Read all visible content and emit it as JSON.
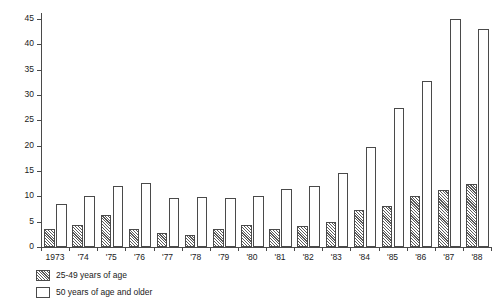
{
  "chart_data": {
    "type": "bar",
    "title": "",
    "subtitle": "",
    "xlabel": "",
    "ylabel": "",
    "ylim": [
      0,
      46
    ],
    "yticks": [
      0,
      5,
      10,
      15,
      20,
      25,
      30,
      35,
      40,
      45
    ],
    "ytick_labels": [
      "0",
      "5",
      "10",
      "15",
      "20",
      "25",
      "30",
      "35",
      "40",
      "45"
    ],
    "grid": false,
    "legend_position": "below-left",
    "categories": [
      "1973",
      "'74",
      "'75",
      "'76",
      "'77",
      "'78",
      "'79",
      "'80",
      "'81",
      "'82",
      "'83",
      "'84",
      "'85",
      "'86",
      "'87",
      "'88"
    ],
    "series": [
      {
        "name": "25-49 years of age",
        "style": "hatched",
        "values": [
          3.5,
          4.3,
          6.4,
          3.6,
          2.8,
          2.4,
          3.5,
          4.4,
          3.5,
          4.1,
          5.0,
          7.3,
          8.0,
          10.0,
          11.3,
          12.5
        ]
      },
      {
        "name": "50 years of age and older",
        "style": "open",
        "values": [
          8.4,
          10.0,
          12.0,
          12.7,
          9.6,
          9.8,
          9.6,
          10.1,
          11.5,
          12.0,
          14.6,
          19.7,
          27.4,
          32.7,
          45.0,
          43.0
        ]
      }
    ]
  },
  "legend": {
    "items": [
      {
        "label": "25-49 years of age",
        "style": "hatched"
      },
      {
        "label": "50 years of age and older",
        "style": "open"
      }
    ]
  },
  "colors": {
    "axis": "#4a4a4a",
    "hatch": "#5a5a5a",
    "bar_fill": "#ffffff",
    "text": "#1a1a1a",
    "background": "#ffffff"
  }
}
